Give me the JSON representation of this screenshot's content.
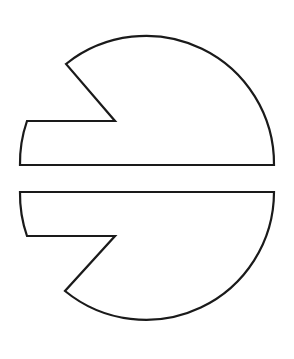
{
  "diagram": {
    "stroke_color": "#1a1a1a",
    "fill_color": "#ffffff",
    "background": "#ffffff",
    "shapes": [
      {
        "name": "upper-half",
        "center": [
          146,
          165
        ],
        "radius": 128
      },
      {
        "name": "lower-half",
        "center": [
          146,
          192
        ],
        "radius": 128
      }
    ]
  }
}
